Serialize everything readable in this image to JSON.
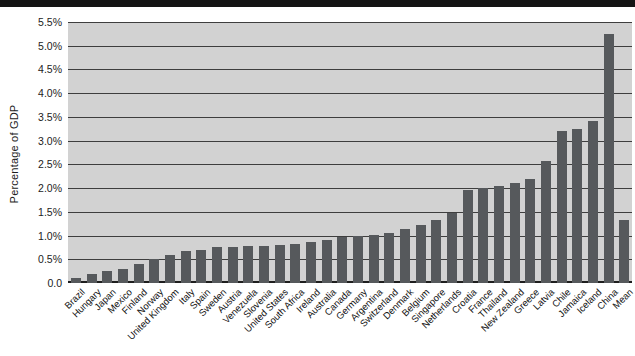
{
  "banner": {
    "note": "black title band cropped at top of screenshot, text not legible",
    "color": "#141414"
  },
  "chart_data": {
    "type": "bar",
    "title": "",
    "xlabel": "",
    "ylabel": "Percentage of GDP",
    "ylim": [
      0,
      5.5
    ],
    "ytick_step": 0.5,
    "ytick_labels_top_to_bottom": [
      "5.5%",
      "5.0%",
      "4.5%",
      "4.0%",
      "3.5%",
      "3.0%",
      "2.5%",
      "2.0%",
      "1.5%",
      "1.0%",
      "0.5%",
      "0.0"
    ],
    "grid": true,
    "legend": false,
    "plot_background": "#d2d2d2",
    "gridline_color": "#3e3e3e",
    "bar_color": "#56595c",
    "categories": [
      "Brazil",
      "Hungary",
      "Japan",
      "Mexico",
      "Finland",
      "Norway",
      "United Kingdom",
      "Italy",
      "Spain",
      "Sweden",
      "Austria",
      "Venezuela",
      "Slovenia",
      "United States",
      "South Africa",
      "Ireland",
      "Australia",
      "Canada",
      "Germany",
      "Argentina",
      "Switzerland",
      "Denmark",
      "Belgium",
      "Singapore",
      "Netherlands",
      "Croatia",
      "France",
      "Thailand",
      "New Zealand",
      "Greece",
      "Latvia",
      "Chile",
      "Jamaica",
      "Iceland",
      "China",
      "Mean"
    ],
    "values": [
      0.1,
      0.2,
      0.25,
      0.3,
      0.4,
      0.5,
      0.58,
      0.67,
      0.7,
      0.75,
      0.76,
      0.78,
      0.79,
      0.81,
      0.83,
      0.87,
      0.91,
      0.97,
      1.0,
      1.02,
      1.06,
      1.14,
      1.23,
      1.32,
      1.47,
      1.95,
      2.0,
      2.05,
      2.1,
      2.2,
      2.58,
      3.2,
      3.25,
      3.42,
      5.25,
      1.32
    ]
  }
}
